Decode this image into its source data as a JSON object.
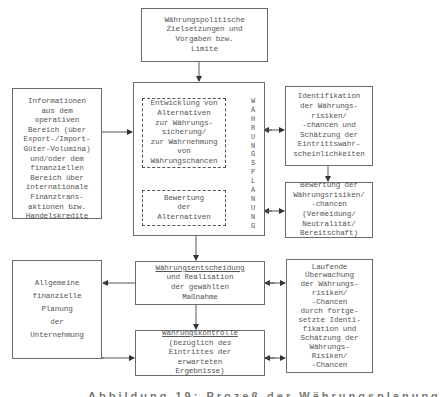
{
  "diagram": {
    "top_box": {
      "lines": "Währungspolitische\nZielsetzungen und\nVorgaben bzw.\nLimite"
    },
    "info_box": {
      "lines": "Informationen\naus dem\noperativen\nBereich (über\nExport-/Import-\nGüter-Volumina)\nund/oder dem\nfinanziellen\nBereich über\ninternationale\nFinanztrans-\naktionen bzw.\nHandelskredite"
    },
    "planning": {
      "vertical_label": "WÄHRUNGSPLANUNG",
      "alternatives_box": {
        "lines": "Entwicklung von\nAlternativen\nzur Währungs-\nsicherung/\nzur Wahrnehmung\nvon\nWährungschancen"
      },
      "evaluation_box": {
        "lines": "Bewertung\nder\nAlternativen"
      }
    },
    "identification_box": {
      "lines": "Identifikation\nder Währungs-\nrisiken/\n-chancen und\nSchätzung der\nEintrittswahr-\nscheinlichkeiten"
    },
    "risk_evaluation_box": {
      "lines": "Bewertung der\nWährungsrisiken/\n-chancen\n(Vermeidung/\nNeutralität/\nBereitschaft)"
    },
    "decision_box": {
      "title": "Währungsentscheidung",
      "lines": "und Realisation\nder gewählten\nMaßnahme"
    },
    "general_planning_box": {
      "lines": "Allgemeine\nfinanzielle\nPlanung\nder\nUnternehmung"
    },
    "control_box": {
      "title": "Währungskontrolle",
      "lines": "(bezüglich des\nEintrittes der\nerwarteten\nErgebnisse)"
    },
    "monitoring_box": {
      "lines": "Laufende\nÜberwachung\nder Währungs-\nrisiken/\n-Chancen\ndurch fortge-\nsetzte Identi-\nfikation und\nSchätzung der\nWährungs-\nRisiken/\n-Chancen"
    }
  },
  "caption": {
    "text": "Abbildung 19: Prozeß der Währungsplanung"
  }
}
